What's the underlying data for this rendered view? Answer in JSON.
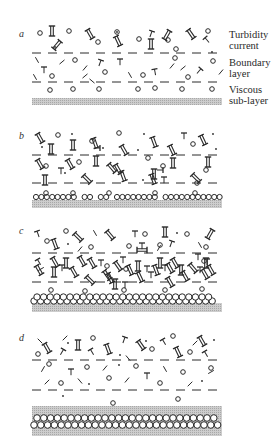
{
  "figure": {
    "panels": [
      {
        "id": "a",
        "letter": "a",
        "letter_pos": [
          19,
          37
        ],
        "dash_lines_y": [
          53,
          82
        ],
        "band": {
          "y": 98,
          "h": 7,
          "x1": 32,
          "x2": 222
        },
        "bed_rows": [],
        "circles": [
          [
            40,
            33
          ],
          [
            69,
            31
          ],
          [
            98,
            42
          ],
          [
            117,
            32
          ],
          [
            139,
            39
          ],
          [
            168,
            40
          ],
          [
            176,
            49
          ],
          [
            208,
            31
          ],
          [
            75,
            60
          ],
          [
            52,
            76
          ],
          [
            105,
            72
          ],
          [
            175,
            58
          ],
          [
            188,
            77
          ],
          [
            143,
            75
          ],
          [
            213,
            61
          ],
          [
            50,
            90
          ],
          [
            73,
            89
          ],
          [
            99,
            89
          ],
          [
            138,
            89
          ],
          [
            155,
            88
          ],
          [
            182,
            89
          ],
          [
            212,
            89
          ]
        ],
        "dots": [
          [
            55,
            47
          ],
          [
            117,
            32
          ],
          [
            212,
            52
          ]
        ],
        "ladders": [
          [
            52,
            31,
            0
          ],
          [
            57,
            45,
            40
          ],
          [
            90,
            34,
            -30
          ],
          [
            118,
            41,
            -25
          ],
          [
            151,
            44,
            0
          ],
          [
            191,
            34,
            -35
          ],
          [
            167,
            35,
            30
          ]
        ],
        "tees": [
          [
            44,
            70,
            0
          ],
          [
            100,
            63,
            20
          ],
          [
            120,
            62,
            0
          ],
          [
            155,
            72,
            -10
          ],
          [
            199,
            71,
            40
          ],
          [
            207,
            40,
            -40
          ],
          [
            151,
            34,
            20
          ]
        ],
        "ticks": [
          [
            37,
            60,
            60
          ],
          [
            62,
            62,
            -40
          ],
          [
            85,
            68,
            -50
          ],
          [
            92,
            81,
            40
          ],
          [
            85,
            76,
            -40
          ],
          [
            130,
            75,
            60
          ],
          [
            172,
            66,
            -50
          ],
          [
            183,
            68,
            -40
          ],
          [
            221,
            72,
            -50
          ],
          [
            35,
            77,
            60
          ]
        ]
      },
      {
        "id": "b",
        "letter": "b",
        "letter_pos": [
          19,
          139
        ],
        "dash_lines_y": [
          155,
          183
        ],
        "band": {
          "y": 200,
          "h": 8,
          "x1": 32,
          "x2": 222
        },
        "bed_rows": [
          {
            "y": 197,
            "r": 2.6,
            "x1": 36,
            "x2": 220,
            "gaps": [
              [
                75,
                80
              ],
              [
                93,
                98
              ],
              [
                108,
                114
              ],
              [
                139,
                143
              ],
              [
                160,
                164
              ]
            ]
          }
        ],
        "circles": [
          [
            58,
            135
          ],
          [
            92,
            141
          ],
          [
            119,
            133
          ],
          [
            148,
            158
          ],
          [
            193,
            144
          ],
          [
            46,
            166
          ],
          [
            79,
            162
          ],
          [
            163,
            166
          ],
          [
            206,
            170
          ],
          [
            46,
            193
          ],
          [
            73,
            193
          ],
          [
            109,
            193
          ],
          [
            155,
            193
          ],
          [
            195,
            193
          ],
          [
            197,
            183
          ]
        ],
        "dots": [
          [
            72,
            134
          ],
          [
            144,
            134
          ],
          [
            213,
            134
          ],
          [
            42,
            147
          ],
          [
            138,
            150
          ],
          [
            216,
            149
          ],
          [
            65,
            173
          ],
          [
            143,
            180
          ],
          [
            103,
            148
          ]
        ],
        "ladders": [
          [
            40,
            138,
            -30
          ],
          [
            51,
            149,
            0
          ],
          [
            73,
            145,
            0
          ],
          [
            95,
            143,
            -20
          ],
          [
            124,
            150,
            -30
          ],
          [
            154,
            142,
            -20
          ],
          [
            172,
            150,
            -25
          ],
          [
            203,
            140,
            -25
          ],
          [
            40,
            164,
            -30
          ],
          [
            70,
            164,
            -30
          ],
          [
            96,
            161,
            0
          ],
          [
            118,
            169,
            -30
          ],
          [
            154,
            174,
            0
          ],
          [
            173,
            163,
            0
          ],
          [
            208,
            162,
            0
          ],
          [
            45,
            180,
            0
          ],
          [
            87,
            179,
            -45
          ],
          [
            123,
            176,
            -20
          ],
          [
            153,
            179,
            -20
          ],
          [
            196,
            178,
            -45
          ],
          [
            112,
            168,
            -40
          ]
        ],
        "tees": [
          [
            184,
            136,
            0
          ],
          [
            61,
            171,
            0
          ],
          [
            97,
            148,
            90
          ],
          [
            160,
            170,
            90
          ],
          [
            164,
            180,
            0
          ]
        ],
        "ticks": []
      },
      {
        "id": "c",
        "letter": "c",
        "letter_pos": [
          19,
          234
        ],
        "dash_lines_y": [
          253,
          282
        ],
        "band": {
          "y": 303,
          "h": 9,
          "x1": 32,
          "x2": 222
        },
        "bed_rows": [
          {
            "y": 301,
            "r": 3.2,
            "x1": 34,
            "x2": 216,
            "gaps": []
          },
          {
            "y": 297,
            "r": 3.2,
            "x1": 37,
            "x2": 212,
            "gaps": []
          }
        ],
        "circles": [
          [
            66,
            231
          ],
          [
            145,
            234
          ],
          [
            187,
            234
          ],
          [
            47,
            241
          ],
          [
            129,
            246
          ],
          [
            160,
            245
          ],
          [
            206,
            247
          ],
          [
            91,
            247
          ],
          [
            51,
            290
          ],
          [
            85,
            291
          ],
          [
            124,
            290
          ],
          [
            165,
            290
          ],
          [
            202,
            289
          ],
          [
            107,
            266
          ],
          [
            126,
            269
          ],
          [
            204,
            261
          ]
        ],
        "dots": [
          [
            68,
            244
          ],
          [
            177,
            233
          ]
        ],
        "ladders": [
          [
            78,
            237,
            -45
          ],
          [
            110,
            235,
            -40
          ],
          [
            165,
            232,
            0
          ],
          [
            210,
            234,
            30
          ],
          [
            55,
            244,
            -20
          ],
          [
            55,
            262,
            -30
          ],
          [
            66,
            263,
            0
          ],
          [
            82,
            261,
            -30
          ],
          [
            92,
            263,
            -30
          ],
          [
            107,
            275,
            -35
          ],
          [
            118,
            266,
            -35
          ],
          [
            138,
            266,
            0
          ],
          [
            160,
            263,
            0
          ],
          [
            175,
            263,
            -30
          ],
          [
            206,
            263,
            0
          ],
          [
            39,
            270,
            -30
          ],
          [
            54,
            272,
            0
          ],
          [
            74,
            272,
            -30
          ],
          [
            90,
            280,
            -45
          ],
          [
            110,
            278,
            -25
          ],
          [
            130,
            270,
            -25
          ],
          [
            140,
            277,
            -25
          ],
          [
            156,
            270,
            -20
          ],
          [
            170,
            268,
            -30
          ],
          [
            185,
            276,
            -30
          ],
          [
            193,
            268,
            -40
          ],
          [
            211,
            270,
            -30
          ],
          [
            142,
            250,
            -90
          ],
          [
            115,
            284,
            0
          ],
          [
            181,
            270,
            0
          ],
          [
            170,
            282,
            -30
          ],
          [
            205,
            274,
            -30
          ]
        ],
        "tees": [
          [
            38,
            234,
            -20
          ],
          [
            135,
            234,
            0
          ],
          [
            142,
            246,
            0
          ],
          [
            171,
            244,
            20
          ],
          [
            39,
            262,
            -30
          ],
          [
            62,
            268,
            0
          ],
          [
            101,
            263,
            0
          ],
          [
            123,
            260,
            0
          ],
          [
            147,
            269,
            0
          ],
          [
            165,
            268,
            0
          ],
          [
            200,
            270,
            0
          ],
          [
            151,
            275,
            0
          ],
          [
            125,
            285,
            0
          ],
          [
            198,
            257,
            0
          ],
          [
            207,
            262,
            0
          ]
        ],
        "ticks": [
          [
            95,
            233,
            60
          ],
          [
            80,
            249,
            -50
          ],
          [
            159,
            248,
            -60
          ],
          [
            200,
            245,
            60
          ],
          [
            41,
            269,
            -30
          ]
        ]
      },
      {
        "id": "d",
        "letter": "d",
        "letter_pos": [
          19,
          341
        ],
        "dash_lines_y": [
          360,
          390
        ],
        "band": {
          "y": 406,
          "h": 30,
          "x1": 32,
          "x2": 222
        },
        "bed_rows": [
          {
            "y": 418,
            "r": 3.3,
            "x1": 37,
            "x2": 219,
            "gaps": []
          },
          {
            "y": 425,
            "r": 3.3,
            "x1": 34,
            "x2": 222,
            "gaps": []
          }
        ],
        "circles": [
          [
            38,
            354
          ],
          [
            93,
            338
          ],
          [
            152,
            349
          ],
          [
            173,
            336
          ],
          [
            190,
            352
          ],
          [
            49,
            364
          ],
          [
            87,
            367
          ],
          [
            136,
            366
          ],
          [
            183,
            372
          ],
          [
            211,
            368
          ],
          [
            109,
            378
          ],
          [
            61,
            383
          ],
          [
            160,
            383
          ],
          [
            113,
            403
          ],
          [
            178,
            399
          ]
        ],
        "dots": [
          [
            68,
            343
          ],
          [
            146,
            341
          ],
          [
            214,
            340
          ],
          [
            120,
            355
          ],
          [
            119,
            365
          ],
          [
            63,
            396
          ],
          [
            89,
            384
          ],
          [
            202,
            381
          ]
        ],
        "ladders": [
          [
            47,
            348,
            -30
          ],
          [
            78,
            345,
            0
          ],
          [
            108,
            349,
            -20
          ],
          [
            141,
            345,
            -35
          ],
          [
            178,
            352,
            -25
          ],
          [
            202,
            341,
            -30
          ]
        ],
        "tees": [
          [
            62,
            352,
            30
          ],
          [
            92,
            352,
            -30
          ],
          [
            124,
            340,
            20
          ],
          [
            164,
            342,
            -30
          ],
          [
            206,
            354,
            -30
          ],
          [
            71,
            372,
            0
          ],
          [
            147,
            376,
            0
          ]
        ],
        "ticks": [
          [
            40,
            341,
            45
          ],
          [
            65,
            338,
            -45
          ],
          [
            128,
            358,
            50
          ],
          [
            105,
            368,
            -50
          ],
          [
            47,
            382,
            -45
          ],
          [
            80,
            381,
            50
          ],
          [
            127,
            380,
            -50
          ],
          [
            165,
            369,
            60
          ],
          [
            190,
            384,
            -45
          ],
          [
            195,
            343,
            -45
          ],
          [
            43,
            369,
            -60
          ],
          [
            211,
            372,
            -30
          ]
        ]
      }
    ],
    "labels": [
      {
        "lines": [
          "Turbidity",
          "current"
        ],
        "top": 29
      },
      {
        "lines": [
          "Boundary",
          "layer"
        ],
        "top": 57
      },
      {
        "lines": [
          "Viscous",
          "sub-layer"
        ],
        "top": 84
      }
    ],
    "colors": {
      "ink": "#2a2a2a",
      "band": "#c9c9c9",
      "band_dot": "#9a9a9a",
      "background": "#ffffff"
    }
  }
}
